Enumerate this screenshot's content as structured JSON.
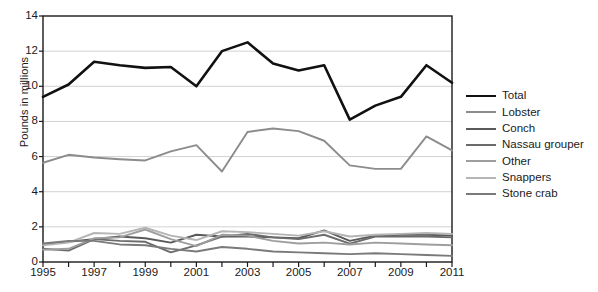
{
  "chart_data": {
    "type": "line",
    "title": "",
    "xlabel": "",
    "ylabel": "Pounds in millions",
    "xlim": [
      1995,
      2011
    ],
    "ylim": [
      0,
      14
    ],
    "yticks": [
      0,
      2,
      4,
      6,
      8,
      10,
      12,
      14
    ],
    "ytick_labels": [
      "0",
      "2",
      "4",
      "6",
      "8",
      "10",
      "12",
      "14"
    ],
    "xticks": [
      1995,
      1996,
      1997,
      1998,
      1999,
      2000,
      2001,
      2002,
      2003,
      2004,
      2005,
      2006,
      2007,
      2008,
      2009,
      2010,
      2011
    ],
    "xtick_labels_shown": [
      "1995",
      "1997",
      "1999",
      "2001",
      "2003",
      "2005",
      "2007",
      "2009",
      "2011"
    ],
    "grid": "horizontal",
    "legend_position": "right",
    "x": [
      1995,
      1996,
      1997,
      1998,
      1999,
      2000,
      2001,
      2002,
      2003,
      2004,
      2005,
      2006,
      2007,
      2008,
      2009,
      2010,
      2011
    ],
    "series": [
      {
        "name": "Total",
        "color": "#111111",
        "width": 2.6,
        "values": [
          9.4,
          10.1,
          11.4,
          11.2,
          11.05,
          11.1,
          10.0,
          12.0,
          12.5,
          11.3,
          10.9,
          11.2,
          8.1,
          8.9,
          9.4,
          11.2,
          10.2
        ]
      },
      {
        "name": "Lobster",
        "color": "#8c8c8c",
        "width": 1.9,
        "values": [
          5.65,
          6.1,
          5.95,
          5.85,
          5.78,
          6.3,
          6.65,
          5.15,
          7.4,
          7.6,
          7.45,
          6.9,
          5.5,
          5.3,
          5.3,
          7.15,
          6.35
        ]
      },
      {
        "name": "Conch",
        "color": "#5a5a5a",
        "width": 1.9,
        "values": [
          1.0,
          1.15,
          1.3,
          1.45,
          1.35,
          1.1,
          1.55,
          1.45,
          1.45,
          1.4,
          1.35,
          1.8,
          1.2,
          1.5,
          1.55,
          1.55,
          1.5
        ]
      },
      {
        "name": "Nassau grouper",
        "color": "#6b6b6b",
        "width": 1.9,
        "values": [
          0.75,
          0.65,
          1.3,
          1.2,
          1.15,
          0.55,
          0.95,
          1.45,
          1.6,
          1.4,
          1.3,
          1.55,
          1.05,
          1.45,
          1.45,
          1.45,
          1.4
        ]
      },
      {
        "name": "Other",
        "color": "#9e9e9e",
        "width": 1.9,
        "values": [
          0.7,
          0.75,
          1.35,
          1.4,
          1.85,
          1.3,
          0.9,
          1.55,
          1.5,
          1.2,
          1.05,
          1.1,
          1.0,
          1.1,
          1.05,
          1.0,
          0.95
        ]
      },
      {
        "name": "Snappers",
        "color": "#b5b5b5",
        "width": 1.9,
        "values": [
          0.95,
          1.1,
          1.65,
          1.6,
          1.95,
          1.5,
          1.25,
          1.75,
          1.7,
          1.6,
          1.5,
          1.75,
          1.45,
          1.55,
          1.6,
          1.65,
          1.6
        ]
      },
      {
        "name": "Stone crab",
        "color": "#7a7a7a",
        "width": 1.9,
        "values": [
          1.05,
          1.2,
          1.2,
          1.0,
          0.95,
          0.75,
          0.6,
          0.85,
          0.75,
          0.6,
          0.55,
          0.5,
          0.45,
          0.5,
          0.45,
          0.4,
          0.35
        ]
      }
    ]
  },
  "legend": {
    "items": [
      {
        "label": "Total"
      },
      {
        "label": "Lobster"
      },
      {
        "label": "Conch"
      },
      {
        "label": "Nassau grouper"
      },
      {
        "label": "Other"
      },
      {
        "label": "Snappers"
      },
      {
        "label": "Stone crab"
      }
    ]
  }
}
